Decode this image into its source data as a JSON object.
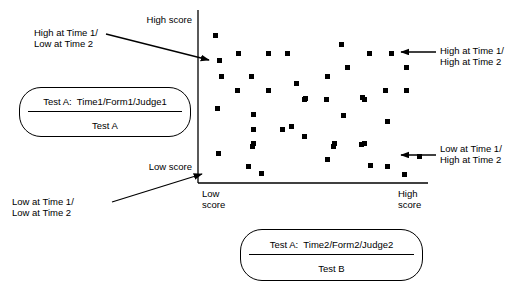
{
  "figure": {
    "type": "scatter",
    "axes": {
      "y_top_label": "High score",
      "y_bottom_label": "Low score",
      "x_left_label_line1": "Low",
      "x_left_label_line2": "score",
      "x_right_label_line1": "High",
      "x_right_label_line2": "score",
      "x_axis": {
        "x1": 198,
        "y1": 183,
        "x2": 428,
        "y2": 183
      },
      "y_axis": {
        "x1": 198,
        "y1": 10,
        "x2": 198,
        "y2": 183
      }
    },
    "annotations": [
      {
        "name": "high-time1-low-time2",
        "line1": "High at Time 1/",
        "line2": "Low at Time 2",
        "text_x": 34,
        "text_y": 27,
        "align": "left",
        "arrow": {
          "x1": 106,
          "y1": 34,
          "x2": 209,
          "y2": 60
        }
      },
      {
        "name": "high-time1-high-time2",
        "line1": "High at Time 1/",
        "line2": "High at Time 2",
        "text_x": 440,
        "text_y": 45,
        "align": "left",
        "arrow": {
          "x1": 436,
          "y1": 52,
          "x2": 401,
          "y2": 52
        }
      },
      {
        "name": "low-time1-high-time2",
        "line1": "Low at Time 1/",
        "line2": "High at Time 2",
        "text_x": 440,
        "text_y": 143,
        "align": "left",
        "arrow": {
          "x1": 436,
          "y1": 155,
          "x2": 401,
          "y2": 155
        }
      },
      {
        "name": "low-time1-low-time2",
        "line1": "Low at Time 1/",
        "line2": "Low at Time 2",
        "text_x": 12,
        "text_y": 196,
        "align": "left",
        "arrow": {
          "x1": 112,
          "y1": 202,
          "x2": 202,
          "y2": 174
        }
      }
    ],
    "legend_boxes": [
      {
        "name": "test-a-key",
        "top_text": "Test A:  Time1/Form1/Judge1",
        "bottom_text": "Test A",
        "x": 19,
        "y": 87,
        "width": 172,
        "height": 50
      },
      {
        "name": "test-b-key",
        "top_text": "Test A:  Time2/Form2/Judge2",
        "bottom_text": "Test B",
        "x": 240,
        "y": 229,
        "width": 183,
        "height": 52
      }
    ],
    "points": [
      [
        213,
        33
      ],
      [
        217,
        58
      ],
      [
        236,
        51
      ],
      [
        266,
        51
      ],
      [
        285,
        51
      ],
      [
        339,
        42
      ],
      [
        367,
        51
      ],
      [
        389,
        51
      ],
      [
        219,
        74
      ],
      [
        249,
        74
      ],
      [
        345,
        65
      ],
      [
        404,
        65
      ],
      [
        235,
        88
      ],
      [
        266,
        88
      ],
      [
        294,
        81
      ],
      [
        325,
        74
      ],
      [
        383,
        88
      ],
      [
        404,
        88
      ],
      [
        303,
        96
      ],
      [
        360,
        95
      ],
      [
        215,
        106
      ],
      [
        251,
        112
      ],
      [
        280,
        127
      ],
      [
        289,
        124
      ],
      [
        251,
        127
      ],
      [
        302,
        97
      ],
      [
        324,
        97
      ],
      [
        362,
        97
      ],
      [
        341,
        113
      ],
      [
        385,
        119
      ],
      [
        251,
        141
      ],
      [
        302,
        134
      ],
      [
        216,
        151
      ],
      [
        250,
        144
      ],
      [
        331,
        144
      ],
      [
        359,
        142
      ],
      [
        325,
        157
      ],
      [
        246,
        164
      ],
      [
        259,
        171
      ],
      [
        368,
        163
      ],
      [
        385,
        164
      ],
      [
        402,
        172
      ],
      [
        417,
        154
      ],
      [
        362,
        141
      ],
      [
        332,
        141
      ]
    ]
  }
}
